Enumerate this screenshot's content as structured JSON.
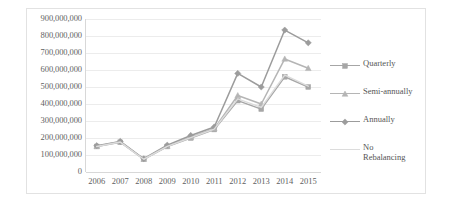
{
  "chart_data": {
    "type": "line",
    "title": "",
    "subtitle": "",
    "xlabel": "",
    "ylabel": "",
    "categories": [
      "2006",
      "2007",
      "2008",
      "2009",
      "2010",
      "2011",
      "2012",
      "2013",
      "2014",
      "2015"
    ],
    "x": [
      2006,
      2007,
      2008,
      2009,
      2010,
      2011,
      2012,
      2013,
      2014,
      2015
    ],
    "ylim": [
      0,
      900000000
    ],
    "ytick_step": 100000000,
    "ytick_labels": [
      "900,000,000",
      "800,000,000",
      "700,000,000",
      "600,000,000",
      "500,000,000",
      "400,000,000",
      "300,000,000",
      "200,000,000",
      "100,000,000",
      "0"
    ],
    "ytick_values": [
      900000000,
      800000000,
      700000000,
      600000000,
      500000000,
      400000000,
      300000000,
      200000000,
      100000000,
      0
    ],
    "grid": true,
    "grid_axis": "y",
    "legend_position": "right",
    "series": [
      {
        "name": "Quarterly",
        "color": "#a6a6a6",
        "marker": "square",
        "values": [
          150000000,
          175000000,
          75000000,
          150000000,
          200000000,
          250000000,
          420000000,
          370000000,
          560000000,
          500000000
        ]
      },
      {
        "name": "Semi-annually",
        "color": "#b5b5b5",
        "marker": "triangle",
        "values": [
          152000000,
          178000000,
          76000000,
          152000000,
          205000000,
          255000000,
          450000000,
          400000000,
          665000000,
          610000000
        ]
      },
      {
        "name": "Annually",
        "color": "#9c9c9c",
        "marker": "diamond",
        "values": [
          155000000,
          180000000,
          78000000,
          158000000,
          215000000,
          265000000,
          580000000,
          500000000,
          835000000,
          760000000
        ]
      },
      {
        "name": "No Rebalancing",
        "color": "#dcdcdc",
        "marker": "none",
        "values": [
          150000000,
          176000000,
          75000000,
          151000000,
          202000000,
          252000000,
          430000000,
          380000000,
          570000000,
          505000000
        ]
      }
    ]
  },
  "legend": {
    "entries": [
      {
        "label": "Quarterly"
      },
      {
        "label": "Semi-annually"
      },
      {
        "label": "Annually"
      },
      {
        "label": "No\nRebalancing"
      }
    ]
  }
}
